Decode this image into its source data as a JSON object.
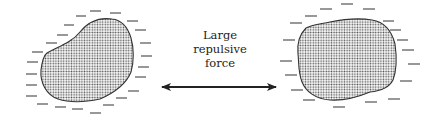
{
  "diagram": {
    "label_lines": [
      "Large",
      "repulsive",
      "force"
    ],
    "colors": {
      "outline": "#333333",
      "stipple": "#555555",
      "charge": "#444444",
      "arrow": "#222222",
      "background": "#ffffff"
    },
    "left_particle": {
      "charge_sign": "negative",
      "charge_symbol": "—"
    },
    "right_particle": {
      "charge_sign": "negative",
      "charge_symbol": "—"
    },
    "arrow": {
      "type": "double-headed",
      "meaning": "repulsion"
    }
  }
}
